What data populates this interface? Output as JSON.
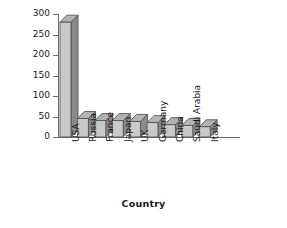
{
  "chart_data": {
    "type": "bar",
    "title": "",
    "subtitle": "",
    "xlabel": "Country",
    "ylabel": "Billion $",
    "categories": [
      "USA",
      "Russia",
      "France",
      "Japan",
      "UK",
      "Germany",
      "China",
      "Saudi Arabia",
      "Italy"
    ],
    "values": [
      280,
      45,
      40,
      40,
      38,
      35,
      30,
      28,
      25
    ],
    "ylim": [
      0,
      300
    ],
    "ytick_labels": [
      "300",
      "250",
      "200",
      "150",
      "100",
      "50",
      "0"
    ],
    "yticks": [
      300,
      250,
      200,
      150,
      100,
      50,
      0
    ],
    "grid": false,
    "legend": null,
    "style": "3d-bar",
    "colors": {
      "bar_front": "#c9c9c9",
      "bar_side": "#8a8a8a",
      "bar_top": "#b3b3b3",
      "bar_outline": "#565656",
      "axis": "#6e6e6e",
      "text": "#1a1a1a",
      "background": "#ffffff"
    }
  }
}
